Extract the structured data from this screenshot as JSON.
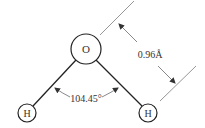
{
  "diagram": {
    "atoms": [
      {
        "id": "O",
        "label": "O",
        "cx": 86,
        "cy": 49,
        "r": 15
      },
      {
        "id": "H1",
        "label": "H",
        "cx": 27,
        "cy": 113,
        "r": 9
      },
      {
        "id": "H2",
        "label": "H",
        "cx": 148,
        "cy": 113,
        "r": 9
      }
    ],
    "bonds": [
      {
        "from": "O",
        "to": "H1"
      },
      {
        "from": "O",
        "to": "H2"
      }
    ],
    "annotations": {
      "bond_angle": "104.45°",
      "bond_length": "0.96Å"
    }
  }
}
